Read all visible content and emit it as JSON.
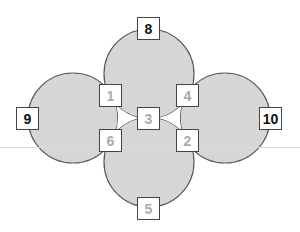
{
  "diagram": {
    "colors": {
      "circle_fill": "#d6d6d6",
      "circle_stroke": "#555555",
      "box_border": "#444444",
      "dark_text": "#111111",
      "light_text": "#aaaaaa",
      "gap_fill": "#ffffff"
    },
    "circles": [
      {
        "id": "top",
        "cx": 149,
        "cy": 74,
        "r": 45
      },
      {
        "id": "bottom",
        "cx": 149,
        "cy": 162,
        "r": 45
      },
      {
        "id": "left",
        "cx": 73,
        "cy": 118,
        "r": 45
      },
      {
        "id": "right",
        "cx": 225,
        "cy": 118,
        "r": 45
      }
    ],
    "boxes": [
      {
        "label": "8",
        "x": 137,
        "y": 17,
        "style": "dark"
      },
      {
        "label": "9",
        "x": 16,
        "y": 107,
        "style": "dark"
      },
      {
        "label": "10",
        "x": 259,
        "y": 107,
        "style": "dark"
      },
      {
        "label": "1",
        "x": 99,
        "y": 84,
        "style": "light"
      },
      {
        "label": "4",
        "x": 176,
        "y": 84,
        "style": "light"
      },
      {
        "label": "3",
        "x": 137,
        "y": 107,
        "style": "light"
      },
      {
        "label": "6",
        "x": 99,
        "y": 129,
        "style": "light"
      },
      {
        "label": "2",
        "x": 176,
        "y": 129,
        "style": "light"
      },
      {
        "label": "5",
        "x": 137,
        "y": 197,
        "style": "light"
      }
    ],
    "box_size": 23,
    "faint_line_y": 147
  }
}
